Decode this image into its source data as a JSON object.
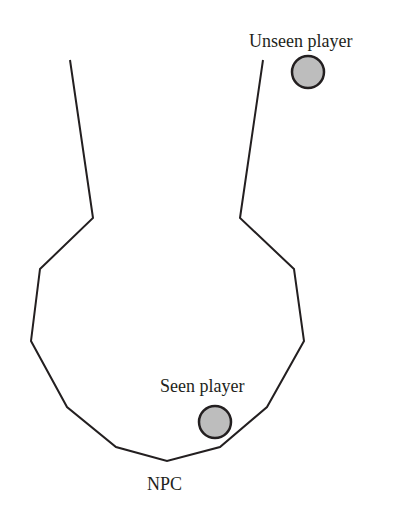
{
  "diagram": {
    "colors": {
      "outline": "#231f20",
      "player_fill": "#bdbdbd",
      "background": "#ffffff"
    },
    "vision_cone": {
      "points": [
        [
          70,
          60
        ],
        [
          93,
          218
        ],
        [
          40,
          269
        ],
        [
          31,
          341
        ],
        [
          67,
          407
        ],
        [
          116,
          447
        ],
        [
          167,
          461
        ],
        [
          220,
          447
        ],
        [
          267,
          407
        ],
        [
          304,
          341
        ],
        [
          294,
          269
        ],
        [
          240,
          218
        ],
        [
          263,
          60
        ]
      ]
    },
    "players": [
      {
        "label": "Unseen player",
        "cx": 308,
        "cy": 72,
        "r": 16,
        "label_x": 249,
        "label_y": 47
      },
      {
        "label": "Seen player",
        "cx": 215,
        "cy": 422,
        "r": 16,
        "label_x": 160,
        "label_y": 392
      }
    ],
    "npc": {
      "label": "NPC",
      "label_x": 147,
      "label_y": 490
    }
  }
}
